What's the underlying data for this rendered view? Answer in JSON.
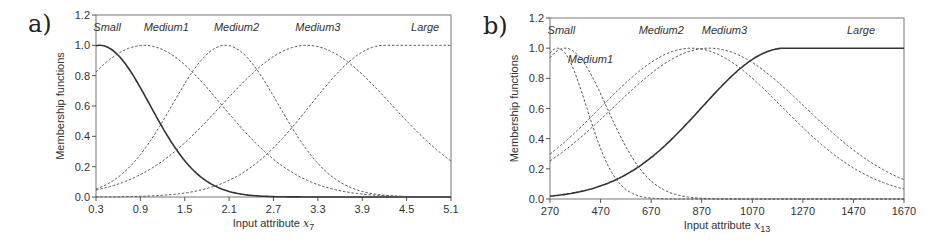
{
  "chart_data": [
    {
      "panel_label": "a)",
      "type": "line",
      "title": "",
      "xlabel": "Input attribute x",
      "xlabel_sub": "7",
      "ylabel": "Membership functions",
      "xlim": [
        0.3,
        5.1
      ],
      "ylim": [
        0.0,
        1.2
      ],
      "xticks": [
        "0.3",
        "0.9",
        "1.5",
        "2.1",
        "2.7",
        "3.3",
        "3.9",
        "4.5",
        "5.1"
      ],
      "yticks": [
        "0.0",
        "0.2",
        "0.4",
        "0.6",
        "0.8",
        "1.0",
        "1.2"
      ],
      "grid": false,
      "legend": "inline labels at top",
      "series": [
        {
          "name": "Small",
          "style": "solid",
          "shape": "gauss",
          "center": 0.35,
          "sigma": 0.68,
          "label_x": 0.45
        },
        {
          "name": "Medium1",
          "style": "dashed",
          "shape": "gauss",
          "center": 0.95,
          "sigma": 1.05,
          "label_x": 1.25
        },
        {
          "name": "Medium2",
          "style": "dashed",
          "shape": "gauss",
          "center": 2.05,
          "sigma": 0.72,
          "label_x": 2.2
        },
        {
          "name": "Medium3",
          "style": "dashed",
          "shape": "gauss",
          "center": 3.15,
          "sigma": 1.15,
          "label_x": 3.3
        },
        {
          "name": "Large",
          "style": "dashed",
          "shape": "zshoulder",
          "center": 4.2,
          "sigma": 1.0,
          "label_x": 4.75
        }
      ],
      "sample_values": {
        "x": [
          0.3,
          0.9,
          1.5,
          2.1,
          2.7,
          3.3,
          3.9,
          4.5,
          5.1
        ],
        "Small": [
          1.0,
          0.72,
          0.24,
          0.04,
          0.0,
          0.0,
          0.0,
          0.0,
          0.0
        ],
        "Medium1": [
          0.82,
          1.0,
          0.87,
          0.72,
          0.45,
          0.22,
          0.11,
          0.04,
          0.01
        ],
        "Medium2": [
          0.05,
          0.28,
          0.75,
          1.0,
          0.7,
          0.3,
          0.09,
          0.03,
          0.01
        ],
        "Medium3": [
          0.08,
          0.24,
          0.45,
          0.72,
          0.93,
          0.99,
          0.8,
          0.5,
          0.24
        ],
        "Large": [
          0.0,
          0.0,
          0.02,
          0.07,
          0.24,
          0.55,
          0.88,
          0.99,
          0.99
        ]
      }
    },
    {
      "panel_label": "b)",
      "type": "line",
      "title": "",
      "xlabel": "Input attribute x",
      "xlabel_sub": "13",
      "ylabel": "Membership functions",
      "xlim": [
        270,
        1670
      ],
      "ylim": [
        0.0,
        1.2
      ],
      "xticks": [
        "270",
        "470",
        "670",
        "870",
        "1070",
        "1270",
        "1470",
        "1670"
      ],
      "yticks": [
        "0.0",
        "0.2",
        "0.4",
        "0.6",
        "0.8",
        "1.0",
        "1.2"
      ],
      "grid": false,
      "legend": "inline labels at top",
      "series": [
        {
          "name": "Small",
          "style": "dashed",
          "shape": "gauss",
          "center": 300,
          "sigma": 115,
          "label_x": 315,
          "label_y": 1.12
        },
        {
          "name": "Medium1",
          "style": "dashed",
          "shape": "gauss",
          "center": 330,
          "sigma": 165,
          "label_x": 430,
          "label_y": 0.93
        },
        {
          "name": "Medium2",
          "style": "dashed",
          "shape": "gauss",
          "center": 830,
          "sigma": 360,
          "label_x": 710,
          "label_y": 1.12
        },
        {
          "name": "Medium3",
          "style": "dashed",
          "shape": "gauss",
          "center": 900,
          "sigma": 380,
          "label_x": 960,
          "label_y": 1.12
        },
        {
          "name": "Large",
          "style": "solid",
          "shape": "zshoulder",
          "center": 1200,
          "sigma": 330,
          "label_x": 1500,
          "label_y": 1.12
        }
      ],
      "sample_values": {
        "x": [
          270,
          470,
          670,
          870,
          1070,
          1270,
          1470,
          1670
        ],
        "Small": [
          0.97,
          0.35,
          0.01,
          0.0,
          0.0,
          0.0,
          0.0,
          0.0
        ],
        "Medium1": [
          0.94,
          0.62,
          0.08,
          0.0,
          0.0,
          0.0,
          0.0,
          0.0
        ],
        "Medium2": [
          0.24,
          0.54,
          0.9,
          0.99,
          0.84,
          0.52,
          0.22,
          0.13
        ],
        "Medium3": [
          0.22,
          0.5,
          0.86,
          1.0,
          0.88,
          0.58,
          0.28,
          0.0
        ],
        "Large": [
          0.0,
          0.03,
          0.13,
          0.45,
          0.88,
          0.99,
          0.99,
          0.99
        ]
      }
    }
  ]
}
